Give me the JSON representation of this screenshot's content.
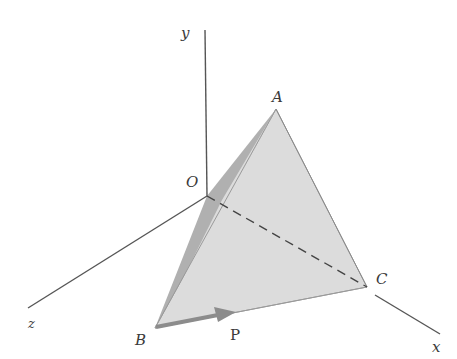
{
  "diagram": {
    "type": "3d-tetrahedron-force",
    "colors": {
      "axis": "#555555",
      "face_light": "#dcdcdc",
      "face_dark": "#a9a9a9",
      "edge": "#8a8a8a",
      "hidden_edge": "#444444",
      "force_arrow": "#8c8c8c",
      "label": "#3a3a3a"
    },
    "axes": [
      {
        "name": "y",
        "label": "y"
      },
      {
        "name": "x",
        "label": "x"
      },
      {
        "name": "z",
        "label": "z"
      }
    ],
    "points": [
      {
        "name": "O",
        "label": "O"
      },
      {
        "name": "A",
        "label": "A"
      },
      {
        "name": "B",
        "label": "B"
      },
      {
        "name": "C",
        "label": "C"
      }
    ],
    "force": {
      "label": "P"
    }
  }
}
